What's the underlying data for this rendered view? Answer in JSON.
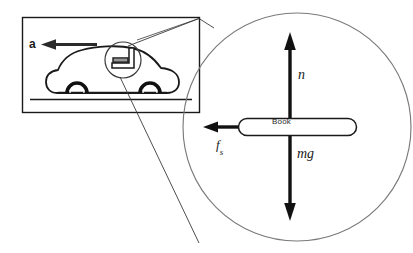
{
  "figure": {
    "background_color": "#ffffff",
    "stroke_color": "#1a1a1a",
    "thin_stroke_color": "#555555"
  },
  "scene_panel": {
    "name": "car-scene",
    "frame": {
      "x": 22,
      "y": 17,
      "width": 178,
      "height": 96
    },
    "acceleration_label": "a",
    "acceleration_direction": "left",
    "road_line_y": 99,
    "car": {
      "wheels": 2
    },
    "inset_circle": {
      "cx": 123,
      "cy": 60,
      "r": 18
    }
  },
  "magnifier": {
    "name": "magnified-free-body-circle",
    "circle": {
      "cx": 297,
      "cy": 127,
      "r": 114
    },
    "object_label": "Book",
    "forces": [
      {
        "symbol": "n",
        "name": "normal-force",
        "direction": "up",
        "magnitude_px": 85
      },
      {
        "symbol": "mg",
        "name": "weight-force",
        "direction": "down",
        "magnitude_px": 85
      },
      {
        "symbol": "f",
        "subscript": "s",
        "name": "static-friction-force",
        "direction": "left",
        "magnitude_px": 88
      }
    ]
  },
  "labels": {
    "acceleration": "a",
    "normal": "n",
    "weight": "mg",
    "friction_main": "f",
    "friction_sub": "s",
    "book": "Book"
  },
  "colors": {
    "stroke": "#1a1a1a",
    "light_stroke": "#6b6b6b",
    "text": "#1a1a1a",
    "background": "#ffffff"
  }
}
